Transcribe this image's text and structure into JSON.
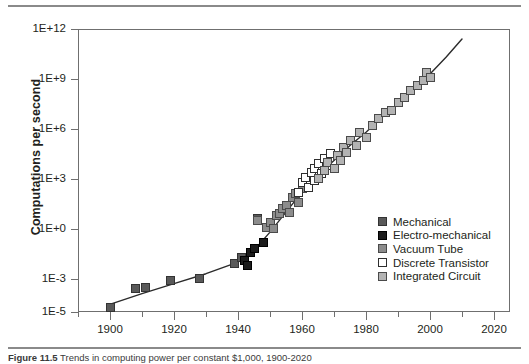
{
  "figure": {
    "caption_label": "Figure 11.5",
    "caption_text": "Trends in computing power per constant $1,000, 1900-2020"
  },
  "chart_data": {
    "type": "scatter",
    "title": "",
    "xlabel": "",
    "ylabel": "Computations per second",
    "xlim": [
      1890,
      2025
    ],
    "ylim_log10": [
      -5,
      12
    ],
    "y_axis_scale": "log",
    "grid": false,
    "legend_position": "inside-bottom-right",
    "ytick_labels": [
      "1E+12",
      "1E+9",
      "1E+6",
      "1E+3",
      "1E+0",
      "1E-3",
      "1E-5"
    ],
    "ytick_log10": [
      12,
      9,
      6,
      3,
      0,
      -3,
      -5
    ],
    "xtick_labels": [
      "1900",
      "1920",
      "1940",
      "1960",
      "1980",
      "2000",
      "2020"
    ],
    "xticks": [
      1900,
      1920,
      1940,
      1960,
      1980,
      2000,
      2020
    ],
    "xminor_ticks": [
      1890,
      1910,
      1930,
      1950,
      1970,
      1990,
      2010
    ],
    "series": [
      {
        "name": "Mechanical",
        "color": "#595959",
        "border": "#333333",
        "filled": true,
        "points": [
          {
            "x": 1900,
            "y_log10": -4.7
          },
          {
            "x": 1908,
            "y_log10": -3.6
          },
          {
            "x": 1911,
            "y_log10": -3.5
          },
          {
            "x": 1919,
            "y_log10": -3.1
          },
          {
            "x": 1928,
            "y_log10": -3.0
          },
          {
            "x": 1939,
            "y_log10": -2.1
          },
          {
            "x": 1941,
            "y_log10": -1.7
          },
          {
            "x": 1946,
            "y_log10": 0.6
          }
        ]
      },
      {
        "name": "Electro-mechanical",
        "color": "#1c1c1c",
        "border": "#000000",
        "filled": true,
        "points": [
          {
            "x": 1942,
            "y_log10": -1.9
          },
          {
            "x": 1943,
            "y_log10": -2.2
          },
          {
            "x": 1944,
            "y_log10": -1.4
          },
          {
            "x": 1945,
            "y_log10": -1.2
          },
          {
            "x": 1948,
            "y_log10": -0.8
          }
        ]
      },
      {
        "name": "Vacuum Tube",
        "color": "#8c8c8c",
        "border": "#4a4a4a",
        "filled": true,
        "points": [
          {
            "x": 1946,
            "y_log10": 0.5
          },
          {
            "x": 1949,
            "y_log10": 0.1
          },
          {
            "x": 1950,
            "y_log10": 0.4
          },
          {
            "x": 1951,
            "y_log10": 0.0
          },
          {
            "x": 1952,
            "y_log10": 0.8
          },
          {
            "x": 1953,
            "y_log10": 0.9
          },
          {
            "x": 1954,
            "y_log10": 1.2
          },
          {
            "x": 1955,
            "y_log10": 1.4
          },
          {
            "x": 1956,
            "y_log10": 1.0
          },
          {
            "x": 1957,
            "y_log10": 1.9
          },
          {
            "x": 1958,
            "y_log10": 2.1
          },
          {
            "x": 1959,
            "y_log10": 1.6
          },
          {
            "x": 1960,
            "y_log10": 2.4
          }
        ]
      },
      {
        "name": "Discrete Transistor",
        "color": "#ffffff",
        "border": "#2e2e2e",
        "filled": false,
        "points": [
          {
            "x": 1959,
            "y_log10": 2.2
          },
          {
            "x": 1960,
            "y_log10": 2.8
          },
          {
            "x": 1961,
            "y_log10": 3.1
          },
          {
            "x": 1962,
            "y_log10": 2.5
          },
          {
            "x": 1963,
            "y_log10": 3.4
          },
          {
            "x": 1964,
            "y_log10": 3.6
          },
          {
            "x": 1964,
            "y_log10": 2.9
          },
          {
            "x": 1965,
            "y_log10": 3.9
          },
          {
            "x": 1966,
            "y_log10": 3.3
          },
          {
            "x": 1967,
            "y_log10": 4.2
          },
          {
            "x": 1968,
            "y_log10": 3.8
          },
          {
            "x": 1969,
            "y_log10": 4.5
          }
        ]
      },
      {
        "name": "Integrated Circuit",
        "color": "#b3b3b3",
        "border": "#4a4a4a",
        "filled": true,
        "points": [
          {
            "x": 1965,
            "y_log10": 3.0
          },
          {
            "x": 1967,
            "y_log10": 3.5
          },
          {
            "x": 1968,
            "y_log10": 4.0
          },
          {
            "x": 1970,
            "y_log10": 3.6
          },
          {
            "x": 1971,
            "y_log10": 4.4
          },
          {
            "x": 1972,
            "y_log10": 4.1
          },
          {
            "x": 1973,
            "y_log10": 4.9
          },
          {
            "x": 1974,
            "y_log10": 4.6
          },
          {
            "x": 1975,
            "y_log10": 5.3
          },
          {
            "x": 1977,
            "y_log10": 5.0
          },
          {
            "x": 1978,
            "y_log10": 5.8
          },
          {
            "x": 1980,
            "y_log10": 5.5
          },
          {
            "x": 1982,
            "y_log10": 6.2
          },
          {
            "x": 1984,
            "y_log10": 6.6
          },
          {
            "x": 1986,
            "y_log10": 7.0
          },
          {
            "x": 1988,
            "y_log10": 7.1
          },
          {
            "x": 1990,
            "y_log10": 7.6
          },
          {
            "x": 1992,
            "y_log10": 7.9
          },
          {
            "x": 1994,
            "y_log10": 8.3
          },
          {
            "x": 1996,
            "y_log10": 8.6
          },
          {
            "x": 1998,
            "y_log10": 8.9
          },
          {
            "x": 1999,
            "y_log10": 9.4
          },
          {
            "x": 2000,
            "y_log10": 9.1
          }
        ]
      }
    ],
    "trendline": {
      "name": "fitted-trend",
      "color": "#2b2b2b",
      "points": [
        {
          "x": 1899,
          "y_log10": -4.6
        },
        {
          "x": 1910,
          "y_log10": -3.9
        },
        {
          "x": 1920,
          "y_log10": -3.3
        },
        {
          "x": 1930,
          "y_log10": -2.7
        },
        {
          "x": 1940,
          "y_log10": -2.0
        },
        {
          "x": 1945,
          "y_log10": -1.3
        },
        {
          "x": 1950,
          "y_log10": -0.2
        },
        {
          "x": 1955,
          "y_log10": 1.0
        },
        {
          "x": 1960,
          "y_log10": 2.2
        },
        {
          "x": 1965,
          "y_log10": 3.2
        },
        {
          "x": 1970,
          "y_log10": 4.1
        },
        {
          "x": 1975,
          "y_log10": 5.0
        },
        {
          "x": 1980,
          "y_log10": 5.8
        },
        {
          "x": 1985,
          "y_log10": 6.7
        },
        {
          "x": 1990,
          "y_log10": 7.5
        },
        {
          "x": 1995,
          "y_log10": 8.4
        },
        {
          "x": 2000,
          "y_log10": 9.3
        },
        {
          "x": 2005,
          "y_log10": 10.3
        },
        {
          "x": 2010,
          "y_log10": 11.4
        }
      ]
    }
  }
}
